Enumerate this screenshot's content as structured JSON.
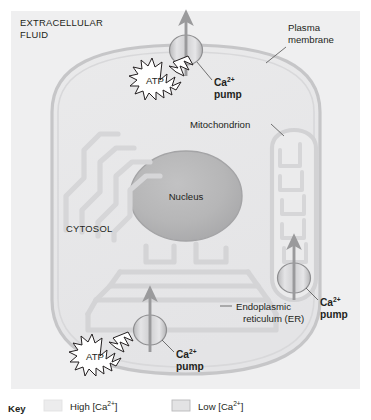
{
  "figure": {
    "background_color": "#ffffff",
    "panel_color": "#efeff0"
  },
  "labels": {
    "extracellular_fluid_line1": "EXTRACELLULAR",
    "extracellular_fluid_line2": "FLUID",
    "plasma_membrane_line1": "Plasma",
    "plasma_membrane_line2": "membrane",
    "cytosol": "CYTOSOL",
    "nucleus": "Nucleus",
    "mitochondrion": "Mitochondrion",
    "er_line1": "Endoplasmic",
    "er_line2": "reticulum (ER)",
    "atp": "ATP"
  },
  "pumps": [
    {
      "id": "plasma-membrane-pump",
      "name_base": "Ca",
      "name_charge": "2+",
      "name_line2": "pump",
      "direction": "out-of-cell"
    },
    {
      "id": "mitochondrion-pump",
      "name_base": "Ca",
      "name_charge": "2+",
      "name_line2": "pump",
      "direction": "into-mitochondrion"
    },
    {
      "id": "er-pump",
      "name_base": "Ca",
      "name_charge": "2+",
      "name_line2": "pump",
      "direction": "into-er"
    }
  ],
  "key": {
    "title": "Key",
    "entries": [
      {
        "label_base": "High [Ca",
        "label_charge": "2+",
        "label_tail": "]",
        "swatch_color": "#ececed",
        "swatch_border": "#e2e2e3"
      },
      {
        "label_base": "Low [Ca",
        "label_charge": "2+",
        "label_tail": "]",
        "swatch_color": "#e3e3e4",
        "swatch_border": "#b9b9ba"
      }
    ]
  },
  "colors": {
    "panel": "#efeff0",
    "cell_fill": "#e8e8e9",
    "cell_stroke": "#c9c9cb",
    "nucleus_fill": "#b7b7b8",
    "nucleus_stroke": "#a9a9ab",
    "organelle_stroke": "#d3d3d5",
    "pump_fill": "#d2d2d4",
    "pump_stroke": "#8e8e90",
    "arrow": "#9a9a9c",
    "text": "#231f20",
    "leader": "#5a5a5a"
  }
}
